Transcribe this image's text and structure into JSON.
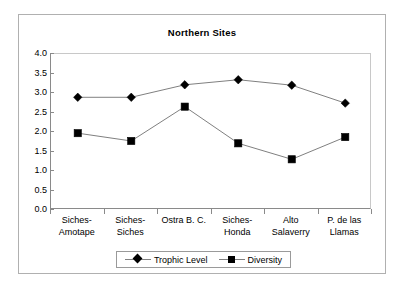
{
  "chart_data": {
    "type": "line",
    "title": "Northern Sites",
    "xlabel": "",
    "ylabel": "",
    "ylim": [
      0.0,
      4.0
    ],
    "ytick_step": 0.5,
    "grid": false,
    "legend_position": "bottom",
    "categories": [
      "Siches-Amotape",
      "Siches-Siches",
      "Ostra B. C.",
      "Siches-Honda",
      "Alto Salaverry",
      "P. de las Llamas"
    ],
    "category_lines": [
      [
        "Siches-",
        "Amotape"
      ],
      [
        "Siches-",
        "Siches"
      ],
      [
        "Ostra B. C.",
        ""
      ],
      [
        "Siches-",
        "Honda"
      ],
      [
        "Alto",
        "Salaverry"
      ],
      [
        "P. de las",
        "Llamas"
      ]
    ],
    "ytick_labels": [
      "4.0",
      "3.5",
      "3.0",
      "2.5",
      "2.0",
      "1.5",
      "1.0",
      "0.5",
      "0.0"
    ],
    "ytick_values": [
      4.0,
      3.5,
      3.0,
      2.5,
      2.0,
      1.5,
      1.0,
      0.5,
      0.0
    ],
    "series": [
      {
        "name": "Trophic Level",
        "marker": "diamond",
        "color": "#000000",
        "line_color": "#808080",
        "values": [
          2.89,
          2.89,
          3.21,
          3.34,
          3.2,
          2.74
        ]
      },
      {
        "name": "Diversity",
        "marker": "square",
        "color": "#000000",
        "line_color": "#808080",
        "values": [
          1.97,
          1.77,
          2.65,
          1.71,
          1.3,
          1.87
        ]
      }
    ]
  },
  "legend": {
    "entries": [
      {
        "label": "Trophic Level",
        "marker": "diamond"
      },
      {
        "label": "Diversity",
        "marker": "square"
      }
    ]
  },
  "colors": {
    "frame": "#b0b0b0",
    "axis": "#8a8a8a",
    "line": "#808080",
    "marker": "#000000",
    "background": "#ffffff"
  }
}
